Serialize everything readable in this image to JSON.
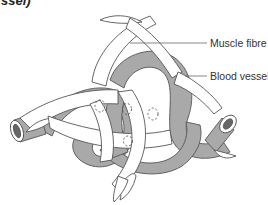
{
  "header_fragment": "ssel)",
  "labels": {
    "muscle_fibre": "Muscle fibre",
    "blood_vessel": "Blood vessel"
  },
  "colors": {
    "vessel_fill": "#a9a9a9",
    "fibre_fill": "#ffffff",
    "outline": "#555555",
    "leader_line": "#666666"
  }
}
